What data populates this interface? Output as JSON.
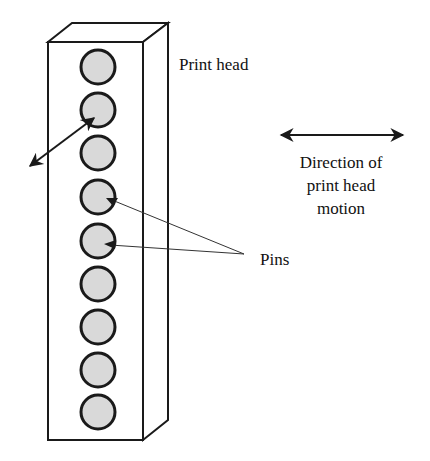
{
  "diagram": {
    "labels": {
      "print_head": "Print head",
      "direction_line1": "Direction of",
      "direction_line2": "print head",
      "direction_line3": "motion",
      "pins": "Pins"
    },
    "pin_count": 9,
    "colors": {
      "stroke": "#1a1a1a",
      "pin_fill": "#d9d9d9",
      "background": "#ffffff"
    }
  }
}
